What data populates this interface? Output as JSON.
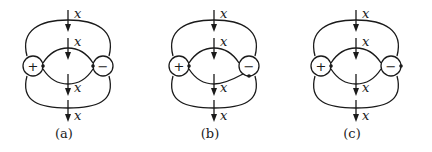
{
  "figure": {
    "panels": [
      {
        "id": "a",
        "caption": "(a)",
        "positive_charge": {
          "sign": "+",
          "dot_side": "right"
        },
        "negative_charge": {
          "sign": "−",
          "dot_side": "left"
        },
        "arrow_labels": [
          "x",
          "x",
          "x",
          "x"
        ]
      },
      {
        "id": "b",
        "caption": "(b)",
        "positive_charge": {
          "sign": "+",
          "dot_side": "right"
        },
        "negative_charge": {
          "sign": "−",
          "dot_side": "bottom"
        },
        "arrow_labels": [
          "x",
          "x",
          "x",
          "x"
        ]
      },
      {
        "id": "c",
        "caption": "(c)",
        "positive_charge": {
          "sign": "+",
          "dot_side": "right"
        },
        "negative_charge": {
          "sign": "−",
          "dot_side": "right"
        },
        "arrow_labels": [
          "x",
          "x",
          "x",
          "x"
        ]
      }
    ]
  }
}
